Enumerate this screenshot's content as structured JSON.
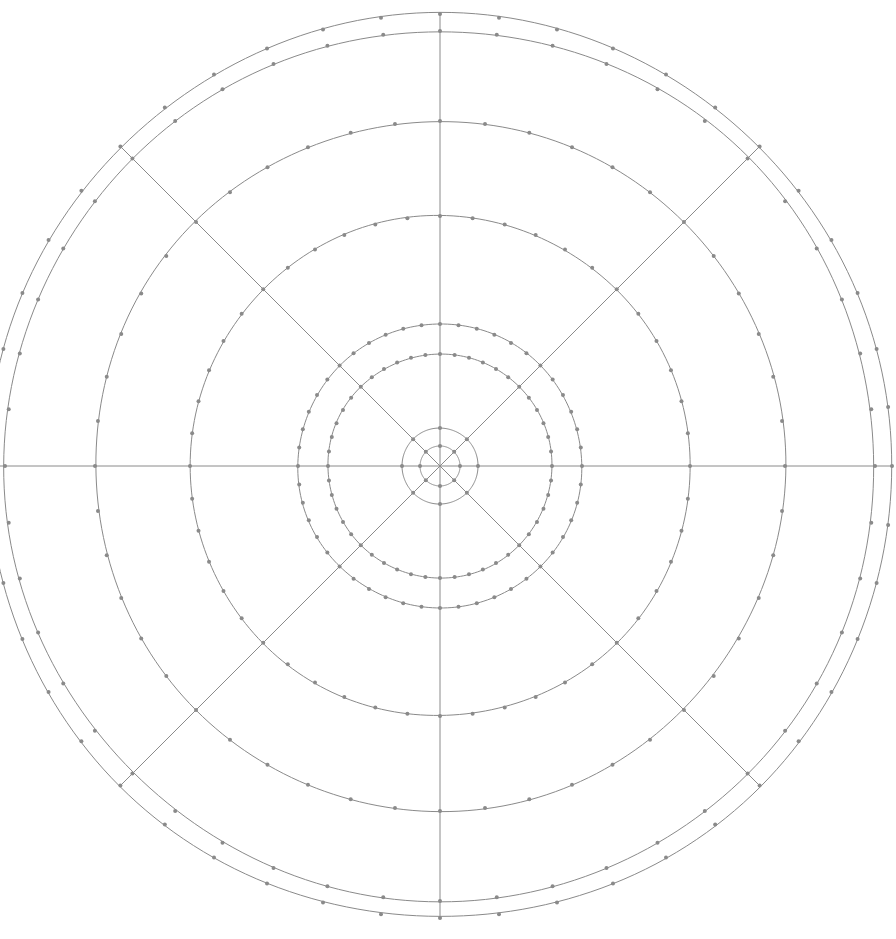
{
  "figure": {
    "type": "polar-grid",
    "width": 896,
    "height": 939,
    "background_color": "#ffffff",
    "line_color": "#8a8a8a",
    "dot_color": "#8a8a8a",
    "line_width": 1.0,
    "dot_radius": 2.0
  },
  "chart_data": {
    "type": "scatter",
    "title": "",
    "subtitle": "",
    "xlabel": "",
    "ylabel": "",
    "grid": true,
    "legend": "none",
    "projection": "polar",
    "center": {
      "x": 440,
      "y": 466
    },
    "radii_px": [
      20,
      38,
      112,
      142,
      250,
      345,
      435,
      452
    ],
    "radii_count": 8,
    "spoke_angles_deg": [
      0,
      45,
      90,
      135,
      180,
      225,
      270,
      315
    ],
    "spoke_count": 8,
    "spoke_extent_px": 452,
    "tick_spacing_deg": 7.5,
    "ticks_per_circle": 48,
    "tick_circles_px": [
      112,
      142,
      250,
      345,
      435,
      452
    ],
    "axis_ranges": {
      "r": [
        0,
        452
      ],
      "theta": [
        0,
        360
      ]
    },
    "annotations": []
  }
}
